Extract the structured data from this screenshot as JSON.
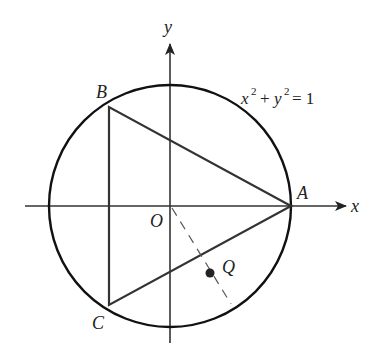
{
  "diagram": {
    "type": "geometry",
    "equation": {
      "lhs_x": "x",
      "exp1": "2",
      "plus": "+",
      "lhs_y": "y",
      "exp2": "2",
      "eq": "= 1"
    },
    "axes": {
      "x_label": "x",
      "y_label": "y",
      "origin_label": "O"
    },
    "points": {
      "A": "A",
      "B": "B",
      "C": "C",
      "Q": "Q"
    },
    "colors": {
      "circle": "#111111",
      "triangle": "#333333",
      "axes": "#333333",
      "dashed": "#555555",
      "point_q": "#222222"
    }
  }
}
